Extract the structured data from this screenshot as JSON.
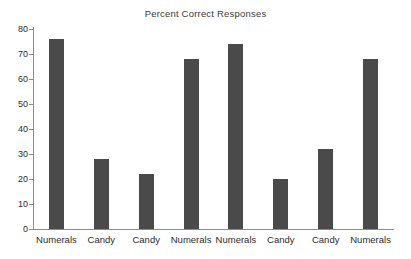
{
  "chart_data": {
    "type": "bar",
    "title": "Percent Correct Responses",
    "xlabel": "",
    "ylabel": "",
    "ylim": [
      0,
      80
    ],
    "yticks": [
      0,
      10,
      20,
      30,
      40,
      50,
      60,
      70,
      80
    ],
    "grid": false,
    "legend": null,
    "bar_color": "#4a4a4a",
    "axis_color": "#8c8c8c",
    "categories": [
      "Numerals",
      "Candy",
      "Candy",
      "Numerals",
      "Numerals",
      "Candy",
      "Candy",
      "Numerals"
    ],
    "values": [
      76,
      28,
      22,
      68,
      74,
      20,
      32,
      68
    ]
  }
}
